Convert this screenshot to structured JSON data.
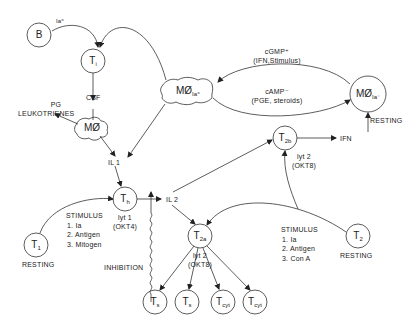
{
  "diagram": {
    "nodes": {
      "b_cell": {
        "label": "B",
        "sup": "Ia⁺"
      },
      "t_i": {
        "label": "T",
        "sub": "i"
      },
      "macrophage_activated": {
        "label": "MØ",
        "sub": "Ia⁺"
      },
      "macrophage_resting": {
        "label": "MØ",
        "sub": "Ia⁻",
        "status": "RESTING"
      },
      "macrophage": {
        "label": "MØ"
      },
      "t_h": {
        "label": "T",
        "sub": "h",
        "marker1": "lyt 1",
        "marker2": "(OKT4)"
      },
      "t1_resting": {
        "label": "T",
        "sub": "1",
        "status": "RESTING"
      },
      "t2_resting": {
        "label": "T",
        "sub": "2",
        "status": "RESTING"
      },
      "t_2a": {
        "label": "T",
        "sub": "2a",
        "marker1": "lyt 2",
        "marker2": "(OKT8)"
      },
      "t_2b": {
        "label": "T",
        "sub": "2b",
        "marker1": "lyt 2",
        "marker2": "(OKT8)"
      },
      "t_s1": {
        "label": "T",
        "sub": "s"
      },
      "t_s2": {
        "label": "T",
        "sub": "s"
      },
      "t_cyt1": {
        "label": "T",
        "sub": "cyt"
      },
      "t_cyt2": {
        "label": "T",
        "sub": "cyt"
      }
    },
    "labels": {
      "csf": "CSF",
      "pg": "PG",
      "leukotrienes": "LEUKOTRIENES",
      "il1": "IL 1",
      "il2": "IL 2",
      "ifn": "IFN",
      "cgmp": "cGMP⁺",
      "cgmp_sub": "(IFN,Stimulus)",
      "camp": "cAMP⁻",
      "camp_sub": "(PGE, steroids)",
      "inhibition": "INHIBITION"
    },
    "stimulus_left": {
      "title": "STIMULUS",
      "items": [
        "1. Ia",
        "2. Antigen",
        "3. Mitogen"
      ]
    },
    "stimulus_right": {
      "title": "STIMULUS",
      "items": [
        "1. Ia",
        "2. Antigen",
        "3. Con A"
      ]
    }
  }
}
